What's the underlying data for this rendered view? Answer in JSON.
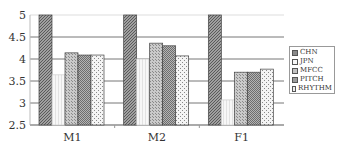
{
  "chart_data": {
    "type": "bar",
    "title": "",
    "xlabel": "",
    "ylabel": "",
    "ylim": [
      2.5,
      5
    ],
    "yticks": [
      "5",
      "4.5",
      "4",
      "3.5",
      "3",
      "2.5"
    ],
    "grid": true,
    "legend_position": "right",
    "categories": [
      "M1",
      "M2",
      "F1"
    ],
    "series": [
      {
        "name": "CHN",
        "values": [
          5.0,
          5.0,
          5.0
        ],
        "fill": "#9a9a9a",
        "pattern": "dense-crosshatch"
      },
      {
        "name": "JPN",
        "values": [
          3.64,
          4.0,
          3.07
        ],
        "fill": "#f4f4f4",
        "pattern": "light-vertical"
      },
      {
        "name": "MFCC",
        "values": [
          4.14,
          4.36,
          3.7
        ],
        "fill": "#c2c2c2",
        "pattern": "dots"
      },
      {
        "name": "PITCH",
        "values": [
          4.09,
          4.3,
          3.7
        ],
        "fill": "#a8a8a8",
        "pattern": "crosshatch"
      },
      {
        "name": "RHYTHM",
        "values": [
          4.09,
          4.07,
          3.77
        ],
        "fill": "#ececec",
        "pattern": "sparse-dots"
      }
    ]
  }
}
